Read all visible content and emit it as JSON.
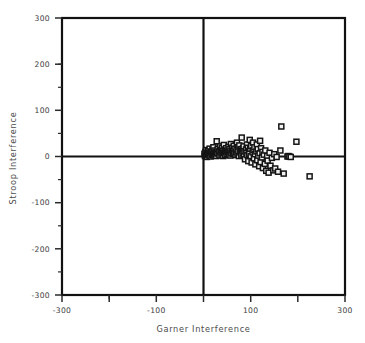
{
  "chart_data": {
    "type": "scatter",
    "title": "",
    "xlabel": "Garner Interference",
    "ylabel": "Stroop Interference",
    "xlim": [
      -300,
      300
    ],
    "ylim": [
      -300,
      300
    ],
    "grid": false,
    "legend": null,
    "xticks_major": [
      -300,
      -100,
      100,
      300
    ],
    "xticks_minor": [
      -200,
      0,
      200
    ],
    "yticks_major": [
      300,
      200,
      100,
      0,
      -100,
      -200,
      -300
    ],
    "xtick_labels": [
      "-300",
      "-100",
      "100",
      "300"
    ],
    "ytick_labels": [
      "300",
      "200",
      "100",
      "0",
      "-100",
      "-200",
      "-300"
    ],
    "marker": "open-square",
    "marker_size": 5,
    "zero_lines": {
      "x": 0,
      "y": 0
    },
    "series": [
      {
        "name": "participants",
        "points": [
          [
            2,
            6
          ],
          [
            3,
            1
          ],
          [
            4,
            10
          ],
          [
            5,
            3
          ],
          [
            6,
            14
          ],
          [
            7,
            -1
          ],
          [
            8,
            8
          ],
          [
            9,
            4
          ],
          [
            10,
            12
          ],
          [
            11,
            2
          ],
          [
            12,
            7
          ],
          [
            13,
            17
          ],
          [
            14,
            5
          ],
          [
            15,
            0
          ],
          [
            16,
            11
          ],
          [
            17,
            9
          ],
          [
            18,
            3
          ],
          [
            19,
            15
          ],
          [
            20,
            6
          ],
          [
            21,
            20
          ],
          [
            22,
            2
          ],
          [
            23,
            13
          ],
          [
            24,
            8
          ],
          [
            25,
            4
          ],
          [
            26,
            10
          ],
          [
            27,
            1
          ],
          [
            28,
            33
          ],
          [
            29,
            7
          ],
          [
            30,
            16
          ],
          [
            32,
            5
          ],
          [
            33,
            11
          ],
          [
            34,
            2
          ],
          [
            35,
            22
          ],
          [
            36,
            9
          ],
          [
            37,
            14
          ],
          [
            38,
            4
          ],
          [
            39,
            19
          ],
          [
            40,
            7
          ],
          [
            41,
            12
          ],
          [
            42,
            1
          ],
          [
            43,
            25
          ],
          [
            44,
            8
          ],
          [
            45,
            15
          ],
          [
            46,
            3
          ],
          [
            47,
            10
          ],
          [
            48,
            18
          ],
          [
            49,
            6
          ],
          [
            50,
            13
          ],
          [
            52,
            9
          ],
          [
            53,
            21
          ],
          [
            54,
            4
          ],
          [
            55,
            16
          ],
          [
            56,
            11
          ],
          [
            57,
            2
          ],
          [
            58,
            27
          ],
          [
            59,
            7
          ],
          [
            60,
            14
          ],
          [
            61,
            19
          ],
          [
            62,
            5
          ],
          [
            63,
            12
          ],
          [
            64,
            23
          ],
          [
            65,
            8
          ],
          [
            66,
            17
          ],
          [
            68,
            3
          ],
          [
            69,
            10
          ],
          [
            70,
            15
          ],
          [
            71,
            30
          ],
          [
            72,
            6
          ],
          [
            73,
            20
          ],
          [
            74,
            11
          ],
          [
            75,
            1
          ],
          [
            76,
            24
          ],
          [
            78,
            9
          ],
          [
            79,
            16
          ],
          [
            80,
            4
          ],
          [
            81,
            41
          ],
          [
            82,
            13
          ],
          [
            83,
            7
          ],
          [
            84,
            18
          ],
          [
            85,
            22
          ],
          [
            86,
            2
          ],
          [
            87,
            11
          ],
          [
            88,
            -6
          ],
          [
            90,
            15
          ],
          [
            91,
            8
          ],
          [
            92,
            26
          ],
          [
            93,
            3
          ],
          [
            94,
            19
          ],
          [
            95,
            -10
          ],
          [
            96,
            12
          ],
          [
            97,
            6
          ],
          [
            98,
            36
          ],
          [
            99,
            17
          ],
          [
            100,
            1
          ],
          [
            101,
            23
          ],
          [
            102,
            -13
          ],
          [
            104,
            9
          ],
          [
            105,
            30
          ],
          [
            106,
            14
          ],
          [
            107,
            -4
          ],
          [
            108,
            20
          ],
          [
            109,
            5
          ],
          [
            110,
            -17
          ],
          [
            112,
            11
          ],
          [
            113,
            26
          ],
          [
            114,
            -8
          ],
          [
            115,
            16
          ],
          [
            116,
            2
          ],
          [
            118,
            -21
          ],
          [
            119,
            7
          ],
          [
            120,
            34
          ],
          [
            121,
            -12
          ],
          [
            122,
            18
          ],
          [
            124,
            -2
          ],
          [
            125,
            10
          ],
          [
            126,
            -25
          ],
          [
            128,
            4
          ],
          [
            130,
            -16
          ],
          [
            131,
            13
          ],
          [
            133,
            -31
          ],
          [
            135,
            1
          ],
          [
            136,
            -9
          ],
          [
            138,
            -35
          ],
          [
            140,
            8
          ],
          [
            142,
            -20
          ],
          [
            145,
            -3
          ],
          [
            148,
            -30
          ],
          [
            150,
            5
          ],
          [
            152,
            -26
          ],
          [
            155,
            -1
          ],
          [
            158,
            -33
          ],
          [
            163,
            13
          ],
          [
            165,
            65
          ],
          [
            170,
            -37
          ],
          [
            178,
            0
          ],
          [
            180,
            1
          ],
          [
            182,
            0
          ],
          [
            185,
            -1
          ],
          [
            197,
            32
          ],
          [
            225,
            -43
          ]
        ]
      }
    ]
  }
}
